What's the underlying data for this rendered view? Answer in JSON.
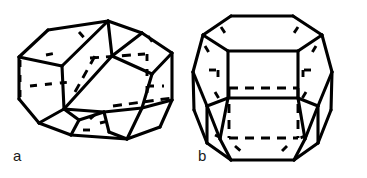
{
  "figure": {
    "caption_labels": {
      "a": "a",
      "b": "b"
    },
    "background_color": "#ffffff",
    "line_color": "#000000",
    "panels": [
      {
        "id": "a",
        "label": "a",
        "name": "irregular-polyhedral-cell",
        "description": "Irregular fourteen-faced polyhedral cell drawn in oblique view, elongated horizontally",
        "visible_edge_style": "solid",
        "hidden_edge_style": "dashed",
        "orientation": "oblique, wide",
        "faces_visible": 7,
        "bounding_box": {
          "x": 8,
          "y": 16,
          "width": 175,
          "height": 125
        }
      },
      {
        "id": "b",
        "label": "b",
        "name": "tetrakaidecahedron-kelvin-cell",
        "description": "Tetrakaidecahedron (Kelvin cell) with square face toward the viewer, hexagonal top face",
        "visible_edge_style": "solid",
        "hidden_edge_style": "dashed",
        "orientation": "upright, square face front",
        "faces_visible": 9,
        "bounding_box": {
          "x": 210,
          "y": 8,
          "width": 148,
          "height": 160
        }
      }
    ]
  }
}
